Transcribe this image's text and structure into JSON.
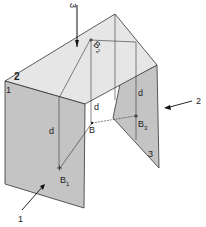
{
  "diagram": {
    "type": "isometric three-plane projection",
    "planes": [
      {
        "id": "1",
        "label": "1",
        "description": "front vertical plane"
      },
      {
        "id": "2",
        "label": "2",
        "description": "top horizontal plane"
      },
      {
        "id": "3",
        "label": "3",
        "description": "side vertical plane"
      }
    ],
    "points": {
      "B": "B",
      "B1": "B",
      "B1_sub": "1",
      "B2": "B",
      "B2_sub": "2",
      "B3": "B",
      "B3_sub": "3"
    },
    "distance_label": "d",
    "view_arrows": [
      {
        "label": "1",
        "direction": "front"
      },
      {
        "label": "2",
        "direction": "top"
      },
      {
        "label": "3",
        "direction": "side"
      }
    ],
    "colors": {
      "top_plane": "#e6e6e6",
      "vertical_plane": "#c4c4c4",
      "line": "#333333"
    }
  }
}
